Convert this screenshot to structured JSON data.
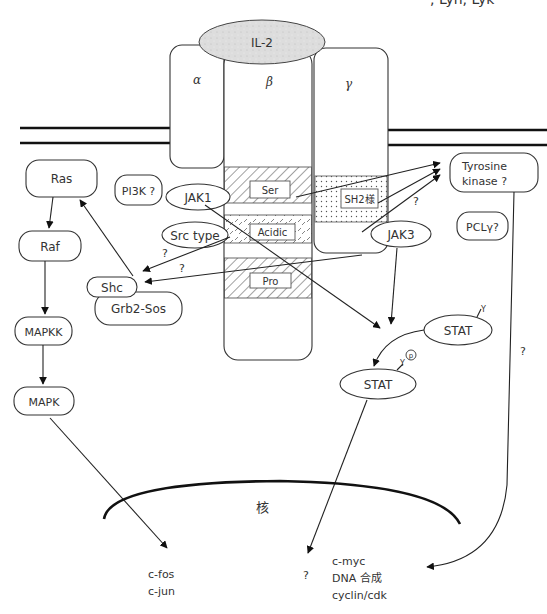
{
  "header_fragment": ", Lyn, Lyk",
  "ligand": {
    "label": "IL-2"
  },
  "receptor": {
    "alpha": "α",
    "beta": "β",
    "gamma": "γ",
    "beta_domains": [
      "Ser",
      "Acidic",
      "Pro"
    ],
    "gamma_domain": "SH2様"
  },
  "nodes": {
    "ras": "Ras",
    "raf": "Raf",
    "mapkk": "MAPKK",
    "mapk": "MAPK",
    "pi3k": "PI3K ?",
    "jak1": "JAK1",
    "src_type": "Src type",
    "shc": "Shc",
    "grb2_sos": "Grb2-Sos",
    "jak3": "JAK3",
    "tyrosine_kinase_line1": "Tyrosine",
    "tyrosine_kinase_line2": "kinase ?",
    "plc_gamma": "PCLγ?",
    "stat_top": "STAT",
    "stat_bottom": "STAT",
    "y_top": "Y",
    "y_bottom": "Y",
    "p_circle": "p"
  },
  "question_marks": {
    "src_to_shc": "?",
    "beta_to_shc": "?",
    "jak3_to_tk": "?",
    "tk_line": "?",
    "stat_output": "?"
  },
  "nucleus": {
    "label": "核",
    "targets_left": [
      "c-fos",
      "c-jun"
    ],
    "targets_mid": "?",
    "targets_right": [
      "c-myc",
      "DNA 合成",
      "cyclin/cdk"
    ]
  }
}
